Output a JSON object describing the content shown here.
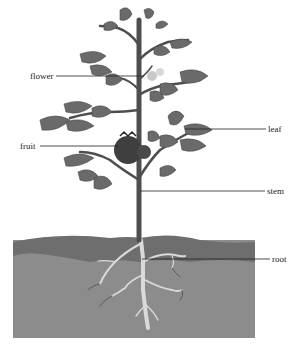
{
  "diagram": {
    "labels": [
      {
        "id": "flower",
        "text": "flower",
        "x": 30,
        "y": 71
      },
      {
        "id": "fruit",
        "text": "fruit",
        "x": 20,
        "y": 141
      },
      {
        "id": "leaf",
        "text": "leaf",
        "x": 268,
        "y": 124
      },
      {
        "id": "stem",
        "text": "stem",
        "x": 267,
        "y": 186
      },
      {
        "id": "root",
        "text": "root",
        "x": 272,
        "y": 254
      }
    ]
  },
  "colors": {
    "leaf": "#6b6b6b",
    "leaf_dark": "#4a4a4a",
    "stem": "#4e4e4e",
    "fruit": "#444444",
    "soil_top": "#6e6e6e",
    "soil": "#8a8a8a",
    "root": "#d8d8d8",
    "line": "#222222"
  }
}
